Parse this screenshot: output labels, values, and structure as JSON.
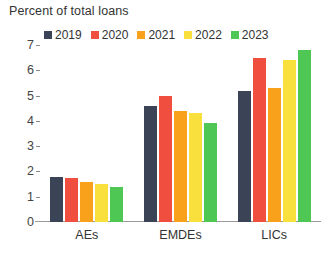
{
  "chart_data": {
    "type": "bar",
    "title": "Percent of total loans",
    "xlabel": "",
    "ylabel": "",
    "categories": [
      "AEs",
      "EMDEs",
      "LICs"
    ],
    "ylim": [
      0,
      7
    ],
    "yticks": [
      0,
      1,
      2,
      3,
      4,
      5,
      6,
      7
    ],
    "grid": false,
    "legend_position": "top",
    "series": [
      {
        "name": "2019",
        "color": "#3a4456",
        "values": [
          1.8,
          4.6,
          5.2
        ]
      },
      {
        "name": "2020",
        "color": "#f04e3e",
        "values": [
          1.75,
          5.0,
          6.5
        ]
      },
      {
        "name": "2021",
        "color": "#f9a11b",
        "values": [
          1.6,
          4.4,
          5.3
        ]
      },
      {
        "name": "2022",
        "color": "#fae03c",
        "values": [
          1.5,
          4.3,
          6.4
        ]
      },
      {
        "name": "2023",
        "color": "#4fc754",
        "values": [
          1.4,
          3.9,
          6.8
        ]
      }
    ]
  }
}
